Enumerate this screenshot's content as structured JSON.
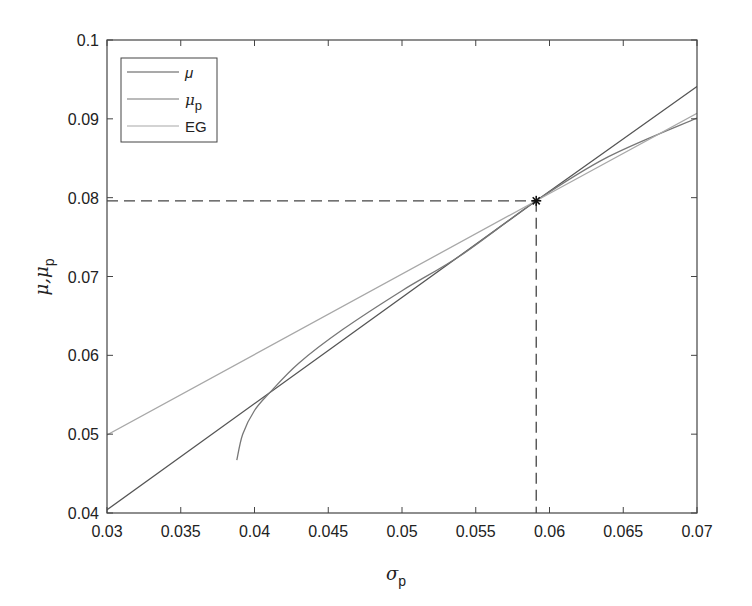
{
  "chart_data": {
    "type": "line",
    "title": "",
    "xlabel": "σ_p",
    "ylabel": "μ, μ_p",
    "xlim": [
      0.03,
      0.07
    ],
    "ylim": [
      0.04,
      0.1
    ],
    "grid": false,
    "legend_position": "upper-left",
    "x_ticks": [
      "0.03",
      "0.035",
      "0.04",
      "0.045",
      "0.05",
      "0.055",
      "0.06",
      "0.065",
      "0.07"
    ],
    "y_ticks": [
      "0.04",
      "0.05",
      "0.06",
      "0.07",
      "0.08",
      "0.09",
      "0.1"
    ],
    "series": [
      {
        "name": "μ",
        "color": "#555555",
        "points": [
          [
            0.03,
            0.0404
          ],
          [
            0.0591,
            0.0796
          ],
          [
            0.07,
            0.0941
          ]
        ]
      },
      {
        "name": "μ_p",
        "color": "#777777",
        "points": [
          [
            0.0388,
            0.0467
          ],
          [
            0.0392,
            0.05
          ],
          [
            0.04,
            0.053
          ],
          [
            0.041,
            0.0552
          ],
          [
            0.043,
            0.059
          ],
          [
            0.046,
            0.0633
          ],
          [
            0.05,
            0.0682
          ],
          [
            0.054,
            0.0727
          ],
          [
            0.0591,
            0.0796
          ],
          [
            0.064,
            0.0852
          ],
          [
            0.07,
            0.0901
          ]
        ]
      },
      {
        "name": "EG",
        "color": "#a8a8a8",
        "points": [
          [
            0.03,
            0.0499
          ],
          [
            0.0591,
            0.0796
          ],
          [
            0.07,
            0.0907
          ]
        ]
      }
    ],
    "annotations": [
      {
        "type": "marker",
        "symbol": "*",
        "x": 0.0591,
        "y": 0.0796,
        "guides": "dashed lines to both axes"
      }
    ]
  },
  "legend": {
    "items": [
      {
        "label": "μ",
        "sub": ""
      },
      {
        "label": "μ",
        "sub": "p"
      },
      {
        "label": "EG",
        "sub": ""
      }
    ]
  },
  "axes": {
    "xlabel_main": "σ",
    "xlabel_sub": "p",
    "ylabel_main": "μ,μ",
    "ylabel_sub": "p"
  }
}
